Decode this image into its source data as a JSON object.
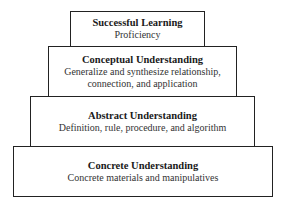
{
  "pyramid": {
    "levels": [
      {
        "title": "Successful Learning",
        "lines": [
          "Proficiency"
        ]
      },
      {
        "title": "Conceptual Understanding",
        "lines": [
          "Generalize and synthesize relationship,",
          "connection, and application"
        ]
      },
      {
        "title": "Abstract Understanding",
        "lines": [
          "Definition, rule, procedure, and algorithm"
        ]
      },
      {
        "title": "Concrete Understanding",
        "lines": [
          "Concrete materials and manipulatives"
        ]
      }
    ]
  }
}
